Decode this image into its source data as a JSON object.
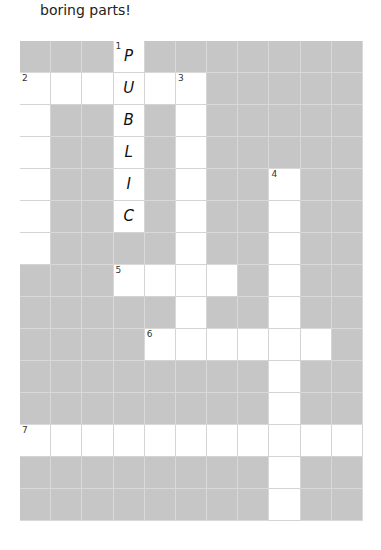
{
  "intro_text": "boring parts!",
  "colors": {
    "block": "#c6c6c6",
    "open": "#ffffff",
    "gridline": "#d9d9d9"
  },
  "grid": {
    "cols": 11,
    "rows": 15,
    "open_cells": [
      {
        "r": 0,
        "c": 3,
        "num": "1",
        "letter": "P"
      },
      {
        "r": 1,
        "c": 0,
        "num": "2"
      },
      {
        "r": 1,
        "c": 1
      },
      {
        "r": 1,
        "c": 2
      },
      {
        "r": 1,
        "c": 3,
        "letter": "U"
      },
      {
        "r": 1,
        "c": 4
      },
      {
        "r": 1,
        "c": 5,
        "num": "3"
      },
      {
        "r": 2,
        "c": 0
      },
      {
        "r": 2,
        "c": 3,
        "letter": "B"
      },
      {
        "r": 2,
        "c": 5
      },
      {
        "r": 3,
        "c": 0
      },
      {
        "r": 3,
        "c": 3,
        "letter": "L"
      },
      {
        "r": 3,
        "c": 5
      },
      {
        "r": 4,
        "c": 0
      },
      {
        "r": 4,
        "c": 3,
        "letter": "I"
      },
      {
        "r": 4,
        "c": 5
      },
      {
        "r": 4,
        "c": 8,
        "num": "4"
      },
      {
        "r": 5,
        "c": 0
      },
      {
        "r": 5,
        "c": 3,
        "letter": "C"
      },
      {
        "r": 5,
        "c": 5
      },
      {
        "r": 5,
        "c": 8
      },
      {
        "r": 6,
        "c": 0
      },
      {
        "r": 6,
        "c": 5
      },
      {
        "r": 6,
        "c": 8
      },
      {
        "r": 7,
        "c": 3,
        "num": "5"
      },
      {
        "r": 7,
        "c": 4
      },
      {
        "r": 7,
        "c": 5
      },
      {
        "r": 7,
        "c": 6
      },
      {
        "r": 7,
        "c": 8
      },
      {
        "r": 8,
        "c": 5
      },
      {
        "r": 8,
        "c": 8
      },
      {
        "r": 9,
        "c": 4,
        "num": "6"
      },
      {
        "r": 9,
        "c": 5
      },
      {
        "r": 9,
        "c": 6
      },
      {
        "r": 9,
        "c": 7
      },
      {
        "r": 9,
        "c": 8
      },
      {
        "r": 9,
        "c": 9
      },
      {
        "r": 10,
        "c": 8
      },
      {
        "r": 11,
        "c": 8
      },
      {
        "r": 12,
        "c": 0,
        "num": "7"
      },
      {
        "r": 12,
        "c": 1
      },
      {
        "r": 12,
        "c": 2
      },
      {
        "r": 12,
        "c": 3
      },
      {
        "r": 12,
        "c": 4
      },
      {
        "r": 12,
        "c": 5
      },
      {
        "r": 12,
        "c": 6
      },
      {
        "r": 12,
        "c": 7
      },
      {
        "r": 12,
        "c": 8
      },
      {
        "r": 12,
        "c": 9
      },
      {
        "r": 12,
        "c": 10
      },
      {
        "r": 13,
        "c": 8
      },
      {
        "r": 14,
        "c": 8
      }
    ]
  }
}
